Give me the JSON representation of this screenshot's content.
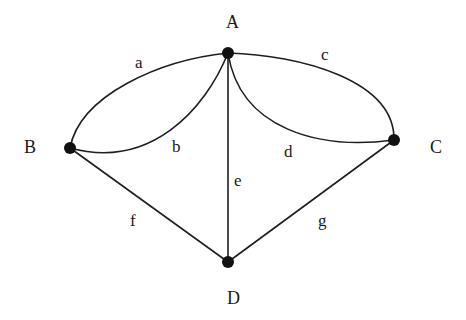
{
  "diagram": {
    "type": "multigraph",
    "nodes": [
      {
        "id": "A",
        "label": "A",
        "x": 228,
        "y": 53
      },
      {
        "id": "B",
        "label": "B",
        "x": 70,
        "y": 148
      },
      {
        "id": "C",
        "label": "C",
        "x": 394,
        "y": 140
      },
      {
        "id": "D",
        "label": "D",
        "x": 228,
        "y": 262
      }
    ],
    "edges": [
      {
        "id": "a",
        "label": "a",
        "from": "A",
        "to": "B",
        "shape": "curve"
      },
      {
        "id": "b",
        "label": "b",
        "from": "A",
        "to": "B",
        "shape": "curve"
      },
      {
        "id": "c",
        "label": "c",
        "from": "A",
        "to": "C",
        "shape": "curve"
      },
      {
        "id": "d",
        "label": "d",
        "from": "A",
        "to": "C",
        "shape": "curve"
      },
      {
        "id": "e",
        "label": "e",
        "from": "A",
        "to": "D",
        "shape": "straight"
      },
      {
        "id": "f",
        "label": "f",
        "from": "B",
        "to": "D",
        "shape": "straight"
      },
      {
        "id": "g",
        "label": "g",
        "from": "C",
        "to": "D",
        "shape": "straight"
      }
    ]
  },
  "labels": {
    "node_a": "A",
    "node_b": "B",
    "node_c": "C",
    "node_d": "D",
    "edge_a": "a",
    "edge_b": "b",
    "edge_c": "c",
    "edge_d": "d",
    "edge_e": "e",
    "edge_f": "f",
    "edge_g": "g"
  },
  "colors": {
    "edge": "#1e1e1e",
    "node": "#111111",
    "background": "#ffffff"
  }
}
